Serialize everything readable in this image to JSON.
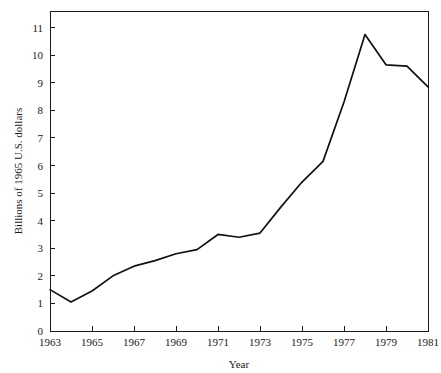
{
  "chart_data": {
    "type": "line",
    "title": "",
    "subtitle": "",
    "xlabel": "Year",
    "ylabel": "Billions of 1965 U.S. dollars",
    "x": [
      1963,
      1964,
      1965,
      1966,
      1967,
      1968,
      1969,
      1970,
      1971,
      1972,
      1973,
      1974,
      1975,
      1976,
      1977,
      1978,
      1979,
      1980,
      1981
    ],
    "values": [
      1.5,
      1.05,
      1.45,
      2.0,
      2.35,
      2.55,
      2.8,
      2.95,
      3.5,
      3.4,
      3.55,
      4.5,
      5.4,
      6.15,
      8.3,
      10.75,
      9.65,
      9.6,
      8.85
    ],
    "series": [
      {
        "name": "Billions of 1965 U.S. dollars",
        "values": [
          1.5,
          1.05,
          1.45,
          2.0,
          2.35,
          2.55,
          2.8,
          2.95,
          3.5,
          3.4,
          3.55,
          4.5,
          5.4,
          6.15,
          8.3,
          10.75,
          9.65,
          9.6,
          8.85
        ]
      }
    ],
    "xlim": [
      1963,
      1981
    ],
    "ylim": [
      0,
      11.6
    ],
    "x_ticks": [
      1963,
      1965,
      1967,
      1969,
      1971,
      1973,
      1975,
      1977,
      1979,
      1981
    ],
    "x_tick_labels": [
      "1963",
      "1965",
      "1967",
      "1969",
      "1971",
      "1973",
      "1975",
      "1977",
      "1979",
      "1981"
    ],
    "x_minor_ticks": [
      1964,
      1966,
      1968,
      1970,
      1972,
      1974,
      1976,
      1978,
      1980
    ],
    "y_ticks": [
      0,
      1,
      2,
      3,
      4,
      5,
      6,
      7,
      8,
      9,
      10,
      11
    ],
    "y_tick_labels": [
      "0",
      "1",
      "2",
      "3",
      "4",
      "5",
      "6",
      "7",
      "8",
      "9",
      "10",
      "11"
    ],
    "grid": false,
    "legend": false,
    "legend_position": "none",
    "line_color": "#111111",
    "axis_color": "#1a1a1a",
    "background_color": "#ffffff"
  }
}
